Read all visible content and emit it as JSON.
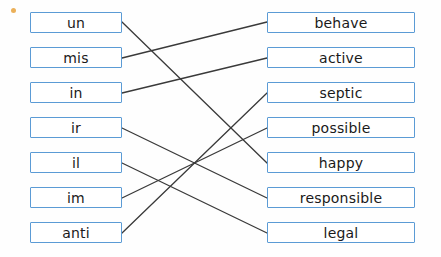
{
  "worksheet": {
    "type": "matching-exercise",
    "marker_dot_color": "#e8a33d",
    "box_border_color": "#5b9bd5",
    "line_color": "#3a3a3a",
    "left_column": [
      {
        "id": "un",
        "label": "un",
        "x": 30,
        "y": 12,
        "w": 92,
        "h": 21
      },
      {
        "id": "mis",
        "label": "mis",
        "x": 30,
        "y": 47,
        "w": 92,
        "h": 21
      },
      {
        "id": "in",
        "label": "in",
        "x": 30,
        "y": 82,
        "w": 92,
        "h": 21
      },
      {
        "id": "ir",
        "label": "ir",
        "x": 30,
        "y": 117,
        "w": 92,
        "h": 21
      },
      {
        "id": "il",
        "label": "il",
        "x": 30,
        "y": 152,
        "w": 92,
        "h": 21
      },
      {
        "id": "im",
        "label": "im",
        "x": 30,
        "y": 187,
        "w": 92,
        "h": 21
      },
      {
        "id": "anti",
        "label": "anti",
        "x": 30,
        "y": 222,
        "w": 92,
        "h": 21
      }
    ],
    "right_column": [
      {
        "id": "behave",
        "label": "behave",
        "x": 267,
        "y": 12,
        "w": 148,
        "h": 21
      },
      {
        "id": "active",
        "label": "active",
        "x": 267,
        "y": 47,
        "w": 148,
        "h": 21
      },
      {
        "id": "septic",
        "label": "septic",
        "x": 267,
        "y": 82,
        "w": 148,
        "h": 21
      },
      {
        "id": "possible",
        "label": "possible",
        "x": 267,
        "y": 117,
        "w": 148,
        "h": 21
      },
      {
        "id": "happy",
        "label": "happy",
        "x": 267,
        "y": 152,
        "w": 148,
        "h": 21
      },
      {
        "id": "responsible",
        "label": "responsible",
        "x": 267,
        "y": 187,
        "w": 148,
        "h": 21
      },
      {
        "id": "legal",
        "label": "legal",
        "x": 267,
        "y": 222,
        "w": 148,
        "h": 21
      }
    ],
    "connections": [
      {
        "from": "un",
        "to": "happy",
        "x1": 122,
        "y1": 22,
        "x2": 267,
        "y2": 163
      },
      {
        "from": "mis",
        "to": "behave",
        "x1": 122,
        "y1": 58,
        "x2": 267,
        "y2": 22
      },
      {
        "from": "in",
        "to": "active",
        "x1": 122,
        "y1": 93,
        "x2": 267,
        "y2": 58
      },
      {
        "from": "ir",
        "to": "responsible",
        "x1": 122,
        "y1": 128,
        "x2": 267,
        "y2": 198
      },
      {
        "from": "il",
        "to": "legal",
        "x1": 122,
        "y1": 163,
        "x2": 267,
        "y2": 233
      },
      {
        "from": "im",
        "to": "possible",
        "x1": 122,
        "y1": 198,
        "x2": 267,
        "y2": 128
      },
      {
        "from": "anti",
        "to": "septic",
        "x1": 122,
        "y1": 233,
        "x2": 267,
        "y2": 93
      }
    ]
  }
}
